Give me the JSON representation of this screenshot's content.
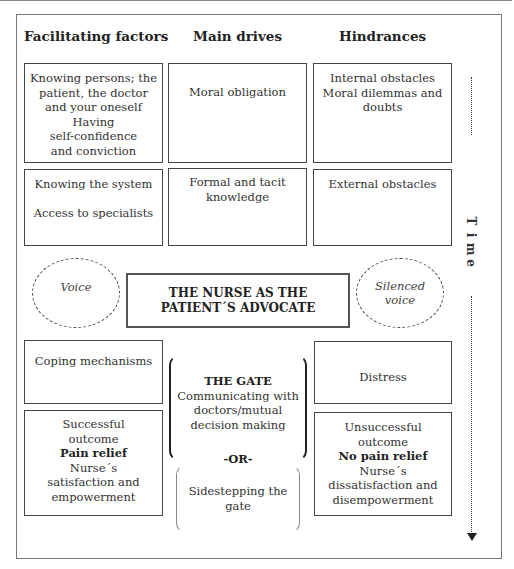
{
  "headings": {
    "facilitating": "Facilitating factors",
    "drives": "Main drives",
    "hindrances": "Hindrances"
  },
  "row1": {
    "facilitating": [
      "Knowing persons; the",
      "patient, the doctor",
      "and your oneself",
      "Having",
      "self-confidence",
      "and conviction"
    ],
    "drives": [
      "Moral obligation"
    ],
    "hindrances": [
      "Internal obstacles",
      "Moral dilemmas and",
      "doubts"
    ]
  },
  "row2": {
    "facilitating": [
      "Knowing the system",
      "Access to specialists"
    ],
    "drives": [
      "Formal and tacit",
      "knowledge"
    ],
    "hindrances": [
      "External obstacles"
    ]
  },
  "center": {
    "voice": "Voice",
    "silenced_voice": [
      "Silenced",
      "voice"
    ],
    "advocate": [
      "THE NURSE AS THE",
      "PATIENT´S ADVOCATE"
    ]
  },
  "row3": {
    "facilitating": [
      "Coping mechanisms"
    ],
    "hindrances": [
      "Distress"
    ]
  },
  "gate": {
    "title": "THE GATE",
    "lines": [
      "Communicating with",
      "doctors/mutual",
      "decision making"
    ],
    "or": "-OR-",
    "sidestep": [
      "Sidestepping the",
      "gate"
    ]
  },
  "outcomes": {
    "success": [
      "Successful",
      "outcome",
      "Pain relief",
      "Nurse´s",
      "satisfaction and",
      "empowerment"
    ],
    "failure": [
      "Unsuccessful",
      "outcome",
      "No pain relief",
      "Nurse´s",
      "dissatisfaction and",
      "disempowerment"
    ]
  },
  "time_axis": {
    "label": [
      "T",
      "i",
      "m",
      "e"
    ]
  }
}
